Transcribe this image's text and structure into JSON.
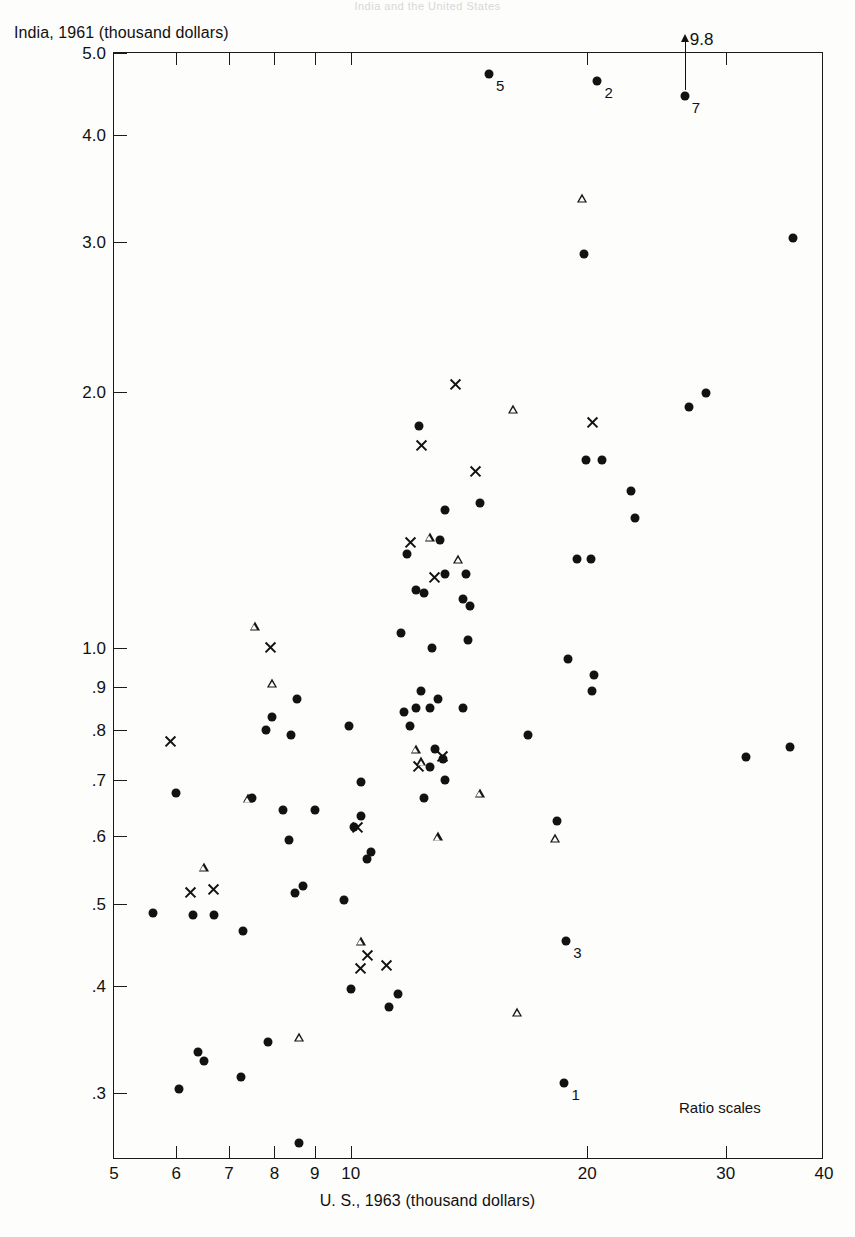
{
  "top_caption": "India and the United States",
  "axes": {
    "ylabel": "India, 1961 (thousand dollars)",
    "xlabel": "U. S., 1963 (thousand dollars)",
    "yticks": [
      "5.0",
      "4.0",
      "3.0",
      "2.0",
      "1.0",
      ".9",
      ".8",
      ".7",
      ".6",
      ".5",
      ".4",
      ".3"
    ],
    "ytick_values": [
      5.0,
      4.0,
      3.0,
      2.0,
      1.0,
      0.9,
      0.8,
      0.7,
      0.6,
      0.5,
      0.4,
      0.3
    ],
    "xticks": [
      "5",
      "6",
      "7",
      "8",
      "9",
      "10",
      "20",
      "30",
      "40"
    ],
    "xtick_values": [
      5,
      6,
      7,
      8,
      9,
      10,
      20,
      30,
      40
    ],
    "ylim": [
      0.25,
      5.0
    ],
    "xlim": [
      5,
      40
    ],
    "yscale": "log",
    "xscale": "log"
  },
  "annotations": {
    "ratio_note": "Ratio scales",
    "offscale": {
      "text": "9.8",
      "x": 26.6,
      "y_marker": 4.45
    }
  },
  "chart_data": {
    "type": "scatter",
    "title": "India and the United States",
    "xlabel": "U. S., 1963 (thousand dollars)",
    "ylabel": "India, 1961 (thousand dollars)",
    "xscale": "log",
    "yscale": "log",
    "xlim": [
      5,
      40
    ],
    "ylim": [
      0.25,
      5.0
    ],
    "grid": false,
    "legend": "none",
    "marker_types": [
      "circle",
      "cross",
      "triangle"
    ],
    "series": [
      {
        "name": "circle",
        "marker": "circle",
        "points": [
          {
            "x": 15.0,
            "y": 4.72,
            "label": "5"
          },
          {
            "x": 20.6,
            "y": 4.63,
            "label": "2"
          },
          {
            "x": 26.6,
            "y": 4.45,
            "label": "7"
          },
          {
            "x": 36.5,
            "y": 3.03
          },
          {
            "x": 19.8,
            "y": 2.9
          },
          {
            "x": 28.3,
            "y": 1.99
          },
          {
            "x": 26.9,
            "y": 1.92
          },
          {
            "x": 12.2,
            "y": 1.82
          },
          {
            "x": 19.9,
            "y": 1.66
          },
          {
            "x": 20.9,
            "y": 1.66
          },
          {
            "x": 22.7,
            "y": 1.53
          },
          {
            "x": 14.6,
            "y": 1.48
          },
          {
            "x": 13.2,
            "y": 1.45
          },
          {
            "x": 23.0,
            "y": 1.42
          },
          {
            "x": 13.0,
            "y": 1.34
          },
          {
            "x": 11.8,
            "y": 1.29
          },
          {
            "x": 19.4,
            "y": 1.27
          },
          {
            "x": 20.2,
            "y": 1.27
          },
          {
            "x": 13.2,
            "y": 1.22
          },
          {
            "x": 14.0,
            "y": 1.22
          },
          {
            "x": 12.1,
            "y": 1.17
          },
          {
            "x": 12.4,
            "y": 1.16
          },
          {
            "x": 13.9,
            "y": 1.14
          },
          {
            "x": 14.2,
            "y": 1.12
          },
          {
            "x": 11.6,
            "y": 1.04
          },
          {
            "x": 14.1,
            "y": 1.02
          },
          {
            "x": 12.7,
            "y": 1.0
          },
          {
            "x": 18.9,
            "y": 0.97
          },
          {
            "x": 20.4,
            "y": 0.93
          },
          {
            "x": 12.3,
            "y": 0.89
          },
          {
            "x": 12.9,
            "y": 0.87
          },
          {
            "x": 20.3,
            "y": 0.89
          },
          {
            "x": 8.55,
            "y": 0.87
          },
          {
            "x": 12.1,
            "y": 0.85
          },
          {
            "x": 12.6,
            "y": 0.85
          },
          {
            "x": 13.9,
            "y": 0.85
          },
          {
            "x": 11.7,
            "y": 0.84
          },
          {
            "x": 9.95,
            "y": 0.81
          },
          {
            "x": 11.9,
            "y": 0.81
          },
          {
            "x": 7.8,
            "y": 0.8
          },
          {
            "x": 8.4,
            "y": 0.79
          },
          {
            "x": 16.8,
            "y": 0.79
          },
          {
            "x": 7.95,
            "y": 0.83
          },
          {
            "x": 12.8,
            "y": 0.76
          },
          {
            "x": 13.1,
            "y": 0.74
          },
          {
            "x": 31.8,
            "y": 0.745
          },
          {
            "x": 36.2,
            "y": 0.765
          },
          {
            "x": 12.6,
            "y": 0.725
          },
          {
            "x": 13.2,
            "y": 0.7
          },
          {
            "x": 10.3,
            "y": 0.695
          },
          {
            "x": 6.0,
            "y": 0.675
          },
          {
            "x": 7.5,
            "y": 0.665
          },
          {
            "x": 12.4,
            "y": 0.665
          },
          {
            "x": 18.3,
            "y": 0.625
          },
          {
            "x": 8.2,
            "y": 0.645
          },
          {
            "x": 9.0,
            "y": 0.645
          },
          {
            "x": 10.3,
            "y": 0.635
          },
          {
            "x": 10.1,
            "y": 0.615
          },
          {
            "x": 8.35,
            "y": 0.595
          },
          {
            "x": 10.6,
            "y": 0.575
          },
          {
            "x": 10.5,
            "y": 0.565
          },
          {
            "x": 8.7,
            "y": 0.525
          },
          {
            "x": 8.5,
            "y": 0.515
          },
          {
            "x": 6.3,
            "y": 0.485
          },
          {
            "x": 6.7,
            "y": 0.485
          },
          {
            "x": 5.6,
            "y": 0.488
          },
          {
            "x": 9.8,
            "y": 0.505
          },
          {
            "x": 7.3,
            "y": 0.465
          },
          {
            "x": 18.8,
            "y": 0.452,
            "label": "3"
          },
          {
            "x": 10.0,
            "y": 0.397
          },
          {
            "x": 11.5,
            "y": 0.392
          },
          {
            "x": 11.2,
            "y": 0.378
          },
          {
            "x": 7.85,
            "y": 0.344
          },
          {
            "x": 6.4,
            "y": 0.335
          },
          {
            "x": 6.5,
            "y": 0.327
          },
          {
            "x": 7.25,
            "y": 0.313
          },
          {
            "x": 6.05,
            "y": 0.303
          },
          {
            "x": 18.7,
            "y": 0.308,
            "label": "1"
          },
          {
            "x": 8.6,
            "y": 0.262
          }
        ]
      },
      {
        "name": "cross",
        "marker": "cross",
        "points": [
          {
            "x": 13.6,
            "y": 2.04
          },
          {
            "x": 20.3,
            "y": 1.84
          },
          {
            "x": 14.4,
            "y": 1.61
          },
          {
            "x": 12.3,
            "y": 1.73
          },
          {
            "x": 11.9,
            "y": 1.33
          },
          {
            "x": 7.9,
            "y": 1.0
          },
          {
            "x": 12.8,
            "y": 1.21
          },
          {
            "x": 5.9,
            "y": 0.775
          },
          {
            "x": 13.1,
            "y": 0.745
          },
          {
            "x": 12.2,
            "y": 0.725
          },
          {
            "x": 10.2,
            "y": 0.615
          },
          {
            "x": 6.25,
            "y": 0.515
          },
          {
            "x": 6.7,
            "y": 0.52
          },
          {
            "x": 10.5,
            "y": 0.435
          },
          {
            "x": 10.3,
            "y": 0.42
          },
          {
            "x": 11.1,
            "y": 0.423
          }
        ]
      },
      {
        "name": "triangle",
        "marker": "triangle",
        "points": [
          {
            "x": 19.7,
            "y": 3.38
          },
          {
            "x": 16.1,
            "y": 1.91
          },
          {
            "x": 12.6,
            "y": 1.35
          },
          {
            "x": 13.7,
            "y": 1.27
          },
          {
            "x": 7.55,
            "y": 1.06
          },
          {
            "x": 7.95,
            "y": 0.91
          },
          {
            "x": 12.1,
            "y": 0.76
          },
          {
            "x": 12.3,
            "y": 0.735
          },
          {
            "x": 7.4,
            "y": 0.665
          },
          {
            "x": 14.6,
            "y": 0.675
          },
          {
            "x": 12.9,
            "y": 0.6
          },
          {
            "x": 18.2,
            "y": 0.597
          },
          {
            "x": 6.5,
            "y": 0.552
          },
          {
            "x": 10.3,
            "y": 0.452
          },
          {
            "x": 16.3,
            "y": 0.373
          },
          {
            "x": 8.6,
            "y": 0.349
          }
        ]
      }
    ]
  }
}
